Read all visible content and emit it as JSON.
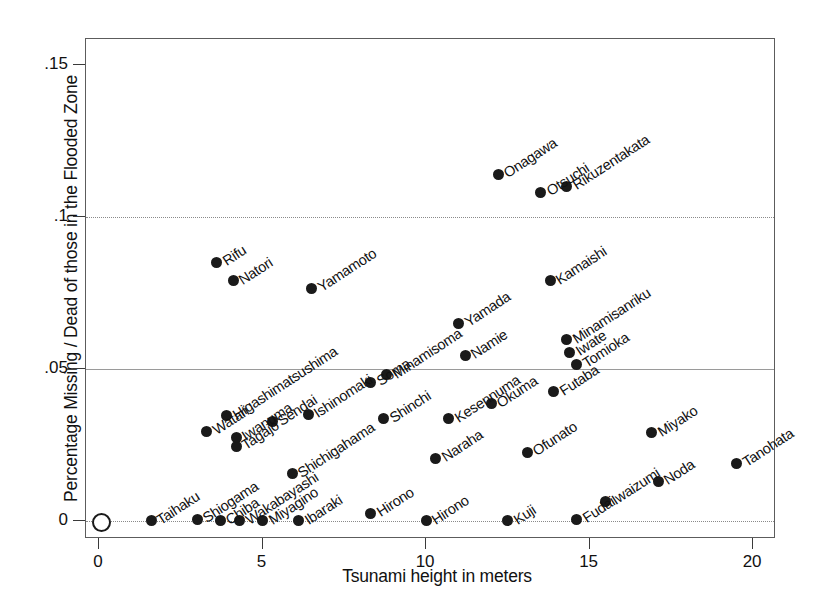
{
  "chart_data": {
    "type": "scatter",
    "title": "",
    "xlabel": "Tsunami height in meters",
    "ylabel": "Percentage Missing / Dead of those in the Flooded Zone",
    "xlim": [
      -0.4,
      20.7
    ],
    "ylim": [
      -0.006,
      0.1585
    ],
    "xticks": [
      0,
      5,
      10,
      15,
      20
    ],
    "xticklabels": [
      "0",
      "5",
      "10",
      "15",
      "20"
    ],
    "yticks": [
      0,
      0.05,
      0.1,
      0.15
    ],
    "yticklabels": [
      "0",
      ".05",
      ".1",
      ".15"
    ],
    "grid": "horizontal-dotted",
    "legend": "none",
    "marker": "filled-circle",
    "point_label_rotation_deg": -33,
    "points": [
      {
        "label": "",
        "x": 0.0,
        "y": 0.0,
        "marker": "open-circle"
      },
      {
        "label": "Taihaku",
        "x": 1.6,
        "y": 0.0
      },
      {
        "label": "Shiogama",
        "x": 3.0,
        "y": 0.0005
      },
      {
        "label": "Chiba",
        "x": 3.7,
        "y": 0.0
      },
      {
        "label": "Wakabayashi",
        "x": 4.3,
        "y": 0.0
      },
      {
        "label": "Miyagino",
        "x": 5.0,
        "y": 0.0
      },
      {
        "label": "Ibaraki",
        "x": 6.1,
        "y": 0.0
      },
      {
        "label": "Hirono",
        "x": 8.3,
        "y": 0.0025
      },
      {
        "label": "Hirono",
        "x": 10.0,
        "y": 0.0
      },
      {
        "label": "Kuji",
        "x": 12.5,
        "y": 0.0
      },
      {
        "label": "Fudai",
        "x": 14.6,
        "y": 0.0005
      },
      {
        "label": "Iwaizumi",
        "x": 15.5,
        "y": 0.0065
      },
      {
        "label": "Noda",
        "x": 17.1,
        "y": 0.013
      },
      {
        "label": "Tanohata",
        "x": 19.5,
        "y": 0.019
      },
      {
        "label": "Miyako",
        "x": 16.9,
        "y": 0.029
      },
      {
        "label": "Ofunato",
        "x": 13.1,
        "y": 0.0225
      },
      {
        "label": "Naraha",
        "x": 10.3,
        "y": 0.0205
      },
      {
        "label": "Shichigahama",
        "x": 5.9,
        "y": 0.0155
      },
      {
        "label": "Tagajo",
        "x": 4.2,
        "y": 0.0245
      },
      {
        "label": "Iwanuma",
        "x": 4.2,
        "y": 0.0275
      },
      {
        "label": "Watari",
        "x": 3.3,
        "y": 0.0295
      },
      {
        "label": "Higashimatsushima",
        "x": 3.9,
        "y": 0.0345
      },
      {
        "label": "Sendai",
        "x": 5.3,
        "y": 0.0325
      },
      {
        "label": "Ishinomaki",
        "x": 6.4,
        "y": 0.035
      },
      {
        "label": "Shinchi",
        "x": 8.7,
        "y": 0.0335
      },
      {
        "label": "Kesennuma",
        "x": 10.7,
        "y": 0.0335
      },
      {
        "label": "Okuma",
        "x": 12.0,
        "y": 0.0385
      },
      {
        "label": "Futaba",
        "x": 13.9,
        "y": 0.0425
      },
      {
        "label": "Tomioka",
        "x": 14.6,
        "y": 0.0515
      },
      {
        "label": "Iwate",
        "x": 14.4,
        "y": 0.0555
      },
      {
        "label": "Minamisanriku",
        "x": 14.3,
        "y": 0.0595
      },
      {
        "label": "Soma",
        "x": 8.3,
        "y": 0.0455
      },
      {
        "label": "Minamisoma",
        "x": 8.8,
        "y": 0.048
      },
      {
        "label": "Namie",
        "x": 11.2,
        "y": 0.0545
      },
      {
        "label": "Yamada",
        "x": 11.0,
        "y": 0.065
      },
      {
        "label": "Kamaishi",
        "x": 13.8,
        "y": 0.079
      },
      {
        "label": "Yamamoto",
        "x": 6.5,
        "y": 0.0765
      },
      {
        "label": "Natori",
        "x": 4.1,
        "y": 0.079
      },
      {
        "label": "Rifu",
        "x": 3.6,
        "y": 0.085
      },
      {
        "label": "Onagawa",
        "x": 12.2,
        "y": 0.114
      },
      {
        "label": "Otsuchi",
        "x": 13.5,
        "y": 0.108
      },
      {
        "label": "Rikuzentakata",
        "x": 14.3,
        "y": 0.11
      }
    ]
  }
}
